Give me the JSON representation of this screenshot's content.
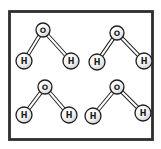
{
  "figure": {
    "type": "illustration",
    "frame": {
      "border_color": "#2e2e2e",
      "background": "#ffffff"
    },
    "bond": {
      "style": "double-line",
      "color": "#1f1f1f"
    },
    "molecules": [
      {
        "name": "top-left",
        "center_atom": "O",
        "left_atom": "H",
        "right_atom": "H"
      },
      {
        "name": "top-right",
        "center_atom": "O",
        "left_atom": "H",
        "right_atom": "H"
      },
      {
        "name": "bottom-left",
        "center_atom": "O",
        "left_atom": "H",
        "right_atom": "H"
      },
      {
        "name": "bottom-right",
        "center_atom": "O",
        "left_atom": "H",
        "right_atom": "H"
      }
    ],
    "colors": {
      "atom_outline": "#1f1f1f",
      "atom_highlight": "#ffffff",
      "atom_fill": "#f2f2f2",
      "atom_shade": "#c6c6c6",
      "text": "#1a1a1a"
    }
  }
}
